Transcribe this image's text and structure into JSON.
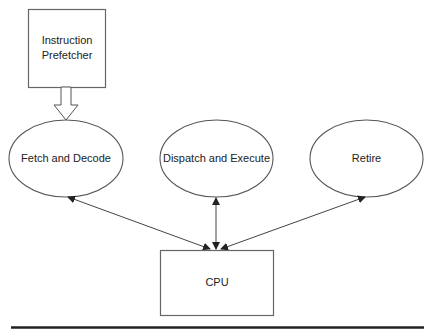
{
  "diagram": {
    "nodes": {
      "prefetcher": {
        "label_line1": "Instruction",
        "label_line2": "Prefetcher",
        "shape": "rectangle"
      },
      "fetch_decode": {
        "label": "Fetch and Decode",
        "shape": "ellipse"
      },
      "dispatch_execute": {
        "label": "Dispatch and Execute",
        "shape": "ellipse"
      },
      "retire": {
        "label": "Retire",
        "shape": "ellipse"
      },
      "cpu": {
        "label": "CPU",
        "shape": "rectangle"
      }
    },
    "edges": [
      {
        "from": "prefetcher",
        "to": "fetch_decode",
        "style": "block-arrow"
      },
      {
        "from": "cpu",
        "to": "fetch_decode",
        "style": "bidirectional"
      },
      {
        "from": "cpu",
        "to": "dispatch_execute",
        "style": "bidirectional"
      },
      {
        "from": "cpu",
        "to": "retire",
        "style": "bidirectional"
      }
    ],
    "colors": {
      "stroke": "#555555",
      "text": "#222222",
      "rule": "#222222"
    }
  }
}
